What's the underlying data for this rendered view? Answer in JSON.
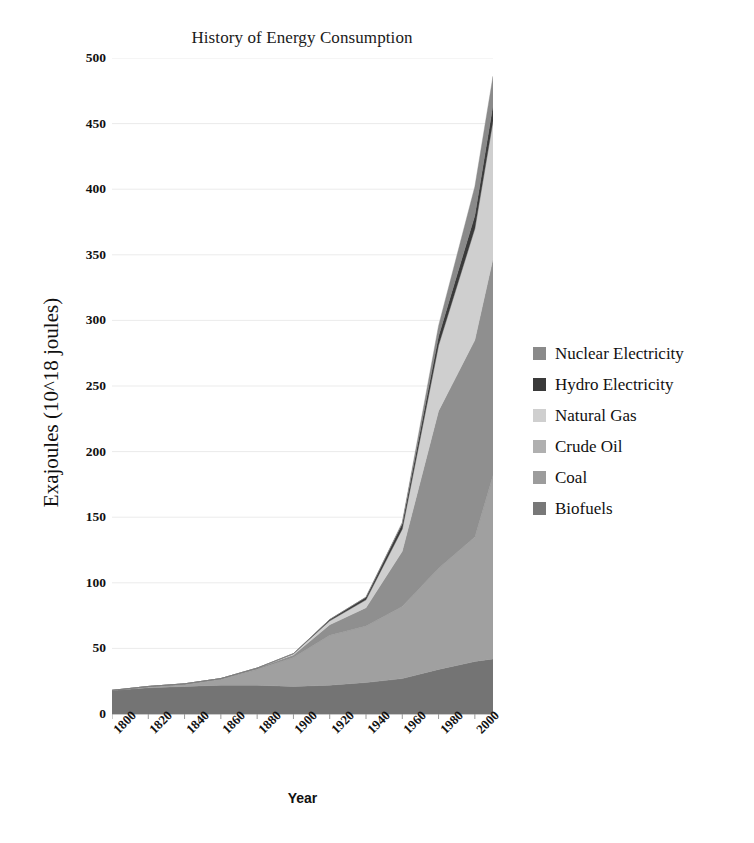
{
  "chart_data": {
    "type": "area",
    "title": "History of Energy Consumption",
    "xlabel": "Year",
    "ylabel": "Exajoules (10^18 joules)",
    "xlim": [
      1800,
      2010
    ],
    "ylim": [
      0,
      500
    ],
    "ytick_step": 50,
    "xtick_step": 20,
    "grid": true,
    "stacked": true,
    "legend_position": "right",
    "yticks": [
      "500",
      "450",
      "400",
      "350",
      "300",
      "250",
      "200",
      "150",
      "100",
      "50",
      "0"
    ],
    "xticks": [
      "1800",
      "1820",
      "1840",
      "1860",
      "1880",
      "1900",
      "1920",
      "1940",
      "1960",
      "1980",
      "2000"
    ],
    "x": [
      1800,
      1820,
      1840,
      1860,
      1880,
      1900,
      1920,
      1940,
      1960,
      1980,
      2000,
      2010
    ],
    "series": [
      {
        "name": "Biofuels",
        "color": "#747474",
        "values": [
          18,
          20,
          21,
          22,
          22,
          21,
          22,
          24,
          27,
          34,
          40,
          42
        ]
      },
      {
        "name": "Coal",
        "color": "#a0a0a0",
        "values": [
          0,
          1,
          2,
          5,
          12,
          22,
          38,
          43,
          55,
          77,
          95,
          140
        ]
      },
      {
        "name": "Crude Oil",
        "color": "#8f8f8f",
        "values": [
          0,
          0,
          0,
          0,
          1,
          2,
          8,
          14,
          42,
          120,
          150,
          165
        ]
      },
      {
        "name": "Natural Gas",
        "color": "#cfcfcf",
        "values": [
          0,
          0,
          0,
          0,
          0,
          1,
          3,
          6,
          17,
          50,
          85,
          105
        ]
      },
      {
        "name": "Hydro Electricity",
        "color": "#3a3a3a",
        "values": [
          0,
          0,
          0,
          0,
          0,
          0,
          1,
          2,
          4,
          7,
          10,
          12
        ]
      },
      {
        "name": "Nuclear Electricity",
        "color": "#8a8a8a",
        "values": [
          0,
          0,
          0,
          0,
          0,
          0,
          0,
          0,
          1,
          8,
          22,
          22
        ]
      }
    ],
    "totals": [
      18,
      21,
      23,
      27,
      35,
      46,
      72,
      89,
      146,
      296,
      402,
      486
    ],
    "peak_value": 437
  },
  "legend": {
    "items": [
      {
        "label": "Nuclear Electricity",
        "color": "#8a8a8a"
      },
      {
        "label": "Hydro Electricity",
        "color": "#3a3a3a"
      },
      {
        "label": "Natural Gas",
        "color": "#cfcfcf"
      },
      {
        "label": "Crude Oil",
        "color": "#b0b0b0"
      },
      {
        "label": "Coal",
        "color": "#9c9c9c"
      },
      {
        "label": "Biofuels",
        "color": "#787878"
      }
    ]
  }
}
